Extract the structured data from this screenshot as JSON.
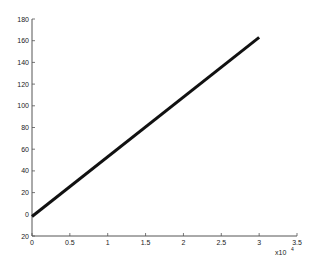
{
  "chart_data": {
    "type": "line",
    "title": "",
    "xlabel": "",
    "ylabel": "",
    "x_multiplier_label": "x10",
    "x_multiplier_exponent": "4",
    "xlim": [
      0,
      3.5
    ],
    "ylim": [
      -20,
      180
    ],
    "x_ticks": [
      "0",
      "0.5",
      "1",
      "1.5",
      "2",
      "2.5",
      "3",
      "3.5"
    ],
    "y_ticks": [
      "20",
      "0",
      "20",
      "40",
      "60",
      "80",
      "100",
      "120",
      "140",
      "160",
      "180"
    ],
    "grid": false,
    "legend": null,
    "series": [
      {
        "name": "line",
        "color": "#111111",
        "x": [
          0,
          3
        ],
        "y": [
          -2,
          163
        ]
      }
    ]
  }
}
